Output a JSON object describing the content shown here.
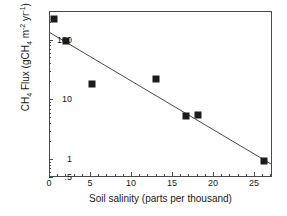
{
  "chart_data": {
    "type": "scatter",
    "title": "",
    "xlabel": "Soil salinity (parts per thousand)",
    "ylabel": "CH4 Flux (gCH4 m-2 yr-1)",
    "xlim": [
      0,
      27.2
    ],
    "ylim": [
      0.5,
      300
    ],
    "yscale": "log",
    "grid": false,
    "legend": null,
    "xticks": [
      "0",
      "5",
      "10",
      "15",
      "20",
      "25"
    ],
    "xtick_values": [
      0,
      5,
      10,
      15,
      20,
      25
    ],
    "yticks": [
      ".5",
      "1",
      "10",
      "100"
    ],
    "ytick_values": [
      0.5,
      1,
      10,
      100
    ],
    "points": [
      {
        "x": 0.5,
        "y": 230
      },
      {
        "x": 2.0,
        "y": 100
      },
      {
        "x": 5.1,
        "y": 19
      },
      {
        "x": 12.9,
        "y": 23
      },
      {
        "x": 16.6,
        "y": 5.5
      },
      {
        "x": 18.1,
        "y": 5.7
      },
      {
        "x": 26.1,
        "y": 0.95
      }
    ],
    "fit_line": {
      "x_start": 0.0,
      "y_start": 135,
      "x_end": 27.2,
      "y_end": 0.82
    },
    "marker": "square",
    "marker_color": "#1c1c1c",
    "line_color": "#4a4a4a",
    "axis_color": "#4a4a4a"
  },
  "axis": {
    "x_title": "Soil salinity (parts per thousand)",
    "y_title_main": "CH",
    "y_title_sub": "4",
    "y_title_rest": " Flux  (gCH",
    "y_title_sub2": "4",
    "y_title_unit_m": " m",
    "y_title_sup_m": "-2",
    "y_title_unit_yr": " yr",
    "y_title_sup_yr": "-1",
    "y_title_close": ")"
  }
}
